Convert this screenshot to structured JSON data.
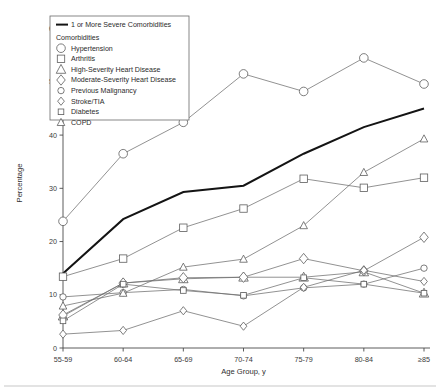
{
  "chart_data": {
    "type": "line",
    "title": "",
    "xlabel": "Age Group, y",
    "ylabel": "Percentage",
    "categories": [
      "55-59",
      "60-64",
      "65-69",
      "70-74",
      "75-79",
      "80-84",
      "≥85"
    ],
    "ylim": [
      0,
      62
    ],
    "yticks": [
      0,
      10,
      20,
      30,
      40,
      50,
      60
    ],
    "ytick_labels": [
      "0",
      "10",
      "20",
      "30",
      "40",
      "50",
      "60"
    ],
    "grid": false,
    "legend_position": "upper-left-inset",
    "series": [
      {
        "name": "1 or More Severe Comorbidities",
        "marker": "none",
        "emphasis": "thick-black-line",
        "values": [
          14.0,
          24.2,
          29.3,
          30.5,
          36.5,
          41.5,
          45.0
        ]
      },
      {
        "name": "Hypertension",
        "marker": "circle-large",
        "values": [
          23.8,
          36.5,
          42.4,
          51.5,
          48.2,
          54.5,
          49.6
        ]
      },
      {
        "name": "Arthritis",
        "marker": "square-large",
        "values": [
          13.4,
          16.8,
          22.6,
          26.2,
          31.8,
          30.1,
          32.0
        ]
      },
      {
        "name": "High-Severity Heart Disease",
        "marker": "triangle-large",
        "values": [
          6.0,
          12.2,
          13.0,
          13.3,
          13.3,
          14.3,
          10.3
        ]
      },
      {
        "name": "Moderate-Severity Heart Disease",
        "marker": "diamond-large",
        "values": [
          6.2,
          12.2,
          13.2,
          13.3,
          16.8,
          14.5,
          20.8
        ]
      },
      {
        "name": "Previous Malignancy",
        "marker": "circle-small",
        "values": [
          9.6,
          10.4,
          11.0,
          9.8,
          11.3,
          12.0,
          15.0
        ]
      },
      {
        "name": "Stroke/TIA",
        "marker": "diamond-small",
        "values": [
          2.6,
          3.3,
          7.0,
          4.1,
          11.4,
          14.6,
          12.5
        ]
      },
      {
        "name": "Diabetes",
        "marker": "square-small",
        "values": [
          5.1,
          12.0,
          10.8,
          9.9,
          13.2,
          12.0,
          10.3
        ]
      },
      {
        "name": "COPD",
        "marker": "triangle-small",
        "values": [
          7.9,
          10.3,
          15.2,
          16.7,
          23.0,
          33.0,
          39.3
        ]
      }
    ]
  },
  "legend": {
    "heading": "Comorbidities",
    "primary_entry": "1 or More Severe Comorbidities",
    "entries": [
      {
        "label": "Hypertension",
        "marker": "circle-large"
      },
      {
        "label": "Arthritis",
        "marker": "square-large"
      },
      {
        "label": "High-Severity Heart Disease",
        "marker": "triangle-large"
      },
      {
        "label": "Moderate-Severity Heart Disease",
        "marker": "diamond-large"
      },
      {
        "label": "Previous Malignancy",
        "marker": "circle-small"
      },
      {
        "label": "Stroke/TIA",
        "marker": "diamond-small"
      },
      {
        "label": "Diabetes",
        "marker": "square-small"
      },
      {
        "label": "COPD",
        "marker": "triangle-small"
      }
    ]
  },
  "colors": {
    "line": "#6e6e6e",
    "emphasis_line": "#141414",
    "axis": "#4a4a4a",
    "text": "#2b2b2b",
    "background": "#ffffff"
  }
}
